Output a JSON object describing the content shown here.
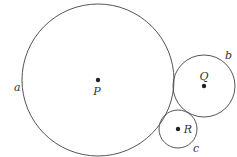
{
  "diagram": {
    "circles": [
      {
        "name": "a",
        "center_label": "P",
        "cx": 98,
        "cy": 80,
        "r": 76,
        "label_x": 14,
        "label_y": 91,
        "center_label_x": 97,
        "center_label_y": 95
      },
      {
        "name": "b",
        "center_label": "Q",
        "cx": 204,
        "cy": 86,
        "r": 31,
        "label_x": 225,
        "label_y": 59,
        "center_label_x": 204,
        "center_label_y": 80
      },
      {
        "name": "c",
        "center_label": "R",
        "cx": 178,
        "cy": 129,
        "r": 19,
        "label_x": 193,
        "label_y": 152,
        "center_label_x": 188,
        "center_label_y": 133
      }
    ],
    "colors": {
      "stroke": "#555555",
      "dot": "#222222",
      "text": "#333333"
    }
  }
}
